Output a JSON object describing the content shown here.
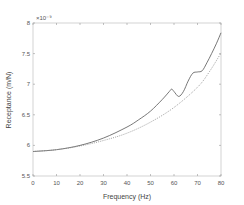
{
  "chart_data": {
    "type": "line",
    "title": "",
    "xlabel": "Frequency (Hz)",
    "ylabel": "Receptance (m/N)",
    "y_exponent_label": "×10⁻⁹",
    "xlim": [
      0,
      80
    ],
    "ylim": [
      5.5,
      8
    ],
    "xticks": [
      0,
      10,
      20,
      30,
      40,
      50,
      60,
      70,
      80
    ],
    "yticks": [
      5.5,
      6,
      6.5,
      7,
      7.5,
      8
    ],
    "ytick_labels": [
      "5.5",
      "6",
      "6.5",
      "7",
      "7.5",
      "8"
    ],
    "grid": false,
    "legend": null,
    "series": [
      {
        "name": "solid",
        "style": "solid",
        "color": "#555555",
        "x": [
          0,
          10,
          20,
          30,
          40,
          45,
          50,
          55,
          58,
          59,
          60,
          62,
          64,
          66,
          68,
          70,
          72,
          74,
          76,
          78,
          80
        ],
        "y": [
          5.9,
          5.93,
          6.0,
          6.12,
          6.3,
          6.42,
          6.56,
          6.75,
          6.88,
          6.92,
          6.88,
          6.8,
          6.88,
          7.05,
          7.18,
          7.2,
          7.22,
          7.35,
          7.5,
          7.66,
          7.84
        ]
      },
      {
        "name": "dotted",
        "style": "dotted",
        "color": "#888888",
        "x": [
          0,
          10,
          20,
          30,
          40,
          50,
          60,
          70,
          75,
          80
        ],
        "y": [
          5.9,
          5.93,
          5.99,
          6.08,
          6.2,
          6.38,
          6.62,
          6.95,
          7.2,
          7.51
        ]
      }
    ]
  }
}
